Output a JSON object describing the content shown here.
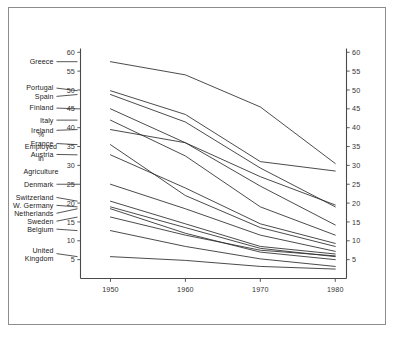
{
  "figure": {
    "frame_color": "#8d8d8d",
    "background": "#ffffff",
    "line_color": "#2b2b2b",
    "axis_color": "#4a4a4a"
  },
  "axis_title": {
    "line1": "%",
    "line2": "Employed",
    "line3": "in",
    "line4": "Agriculture"
  },
  "chart_data": {
    "type": "line",
    "title": "",
    "subtitle": "",
    "xlabel": "",
    "ylabel": "% Employed in Agriculture",
    "x": [
      1950,
      1960,
      1970,
      1980
    ],
    "xticklabels": [
      "1950",
      "1960",
      "1970",
      "1980"
    ],
    "xlim": [
      1946,
      1981.5
    ],
    "ylim": [
      0,
      61
    ],
    "yticks": [
      5,
      10,
      15,
      20,
      25,
      30,
      35,
      40,
      45,
      50,
      55,
      60
    ],
    "yticklabels": [
      "5",
      "10",
      "15",
      "20",
      "25",
      "30",
      "35",
      "40",
      "45",
      "50",
      "55",
      "60"
    ],
    "grid": false,
    "legend_position": "inline-left-labels",
    "right_axis_mirrors_left": true,
    "series": [
      {
        "name": "Greece",
        "label": "Greece",
        "values": [
          57.5,
          54.0,
          45.5,
          30.5
        ]
      },
      {
        "name": "Portugal",
        "label": "Portugal",
        "values": [
          49.8,
          43.5,
          31.0,
          28.5
        ]
      },
      {
        "name": "Spain",
        "label": "Spain",
        "values": [
          48.8,
          41.5,
          29.3,
          19.0
        ]
      },
      {
        "name": "Finland",
        "label": "Finland",
        "values": [
          45.0,
          36.0,
          24.5,
          14.2
        ]
      },
      {
        "name": "Italy",
        "label": "Italy",
        "values": [
          42.0,
          32.5,
          19.0,
          11.5
        ]
      },
      {
        "name": "Ireland",
        "label": "Ireland",
        "values": [
          39.5,
          36.0,
          27.0,
          19.5
        ]
      },
      {
        "name": "France",
        "label": "France",
        "values": [
          35.5,
          22.0,
          13.5,
          8.5
        ]
      },
      {
        "name": "Austria",
        "label": "Austria",
        "values": [
          32.8,
          24.0,
          14.5,
          9.3
        ]
      },
      {
        "name": "Denmark",
        "label": "Denmark",
        "values": [
          25.0,
          18.5,
          11.5,
          7.2
        ]
      },
      {
        "name": "Switzerland",
        "label": "Switzerland",
        "values": [
          20.5,
          14.5,
          8.5,
          6.5
        ]
      },
      {
        "name": "W. Germany",
        "label": "W. Germany",
        "values": [
          19.0,
          13.5,
          8.0,
          5.8
        ]
      },
      {
        "name": "Netherlands",
        "label": "Netherlands",
        "values": [
          18.5,
          12.0,
          7.0,
          5.0
        ]
      },
      {
        "name": "Sweden",
        "label": "Sweden",
        "values": [
          16.3,
          11.5,
          7.5,
          6.0
        ]
      },
      {
        "name": "Belgium",
        "label": "Belgium",
        "values": [
          12.7,
          8.5,
          5.2,
          3.2
        ]
      },
      {
        "name": "United Kingdom",
        "label": "United\nKingdom",
        "values": [
          5.8,
          4.8,
          3.2,
          2.5
        ]
      }
    ],
    "label_anchors": [
      {
        "series": "Greece",
        "text_lines": [
          "Greece"
        ],
        "text_y": 57.5,
        "leader_from": 57.5
      },
      {
        "series": "Portugal",
        "text_lines": [
          "Portugal"
        ],
        "text_y": 50.5,
        "leader_from": 49.8
      },
      {
        "series": "Spain",
        "text_lines": [
          "Spain"
        ],
        "text_y": 48.3,
        "leader_from": 48.8
      },
      {
        "series": "Finland",
        "text_lines": [
          "Finland"
        ],
        "text_y": 45.2,
        "leader_from": 45.0
      },
      {
        "series": "Italy",
        "text_lines": [
          "Italy"
        ],
        "text_y": 42.0,
        "leader_from": 42.0
      },
      {
        "series": "Ireland",
        "text_lines": [
          "Ireland"
        ],
        "text_y": 39.3,
        "leader_from": 39.5
      },
      {
        "series": "France",
        "text_lines": [
          "France"
        ],
        "text_y": 35.8,
        "leader_from": 35.5
      },
      {
        "series": "Austria",
        "text_lines": [
          "Austria"
        ],
        "text_y": 32.9,
        "leader_from": 32.8
      },
      {
        "series": "Denmark",
        "text_lines": [
          "Denmark"
        ],
        "text_y": 25.0,
        "leader_from": 25.0
      },
      {
        "series": "Switzerland",
        "text_lines": [
          "Switzerland"
        ],
        "text_y": 21.5,
        "leader_from": 20.5
      },
      {
        "series": "W. Germany",
        "text_lines": [
          "W. Germany"
        ],
        "text_y": 19.4,
        "leader_from": 19.0
      },
      {
        "series": "Netherlands",
        "text_lines": [
          "Netherlands"
        ],
        "text_y": 17.3,
        "leader_from": 18.5
      },
      {
        "series": "Sweden",
        "text_lines": [
          "Sweden"
        ],
        "text_y": 15.2,
        "leader_from": 16.3
      },
      {
        "series": "Belgium",
        "text_lines": [
          "Belgium"
        ],
        "text_y": 13.1,
        "leader_from": 12.7
      },
      {
        "series": "United Kingdom",
        "text_lines": [
          "United",
          "Kingdom"
        ],
        "text_y": 6.6,
        "leader_from": 5.8
      }
    ]
  }
}
